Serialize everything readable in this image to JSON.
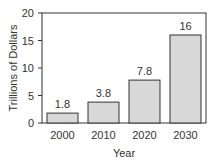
{
  "chart_data": {
    "type": "bar",
    "title": "",
    "xlabel": "Year",
    "ylabel": "Trillions of Dollars",
    "categories": [
      "2000",
      "2010",
      "2020",
      "2030"
    ],
    "values": [
      1.8,
      3.8,
      7.8,
      16
    ],
    "data_labels": [
      "1.8",
      "3.8",
      "7.8",
      "16"
    ],
    "ylim": [
      0,
      20
    ],
    "yticks": [
      "0",
      "5",
      "10",
      "15",
      "20"
    ],
    "grid": false,
    "legend": null,
    "bar_color": "#d8d8d8",
    "bar_edge_color": "#333333"
  }
}
